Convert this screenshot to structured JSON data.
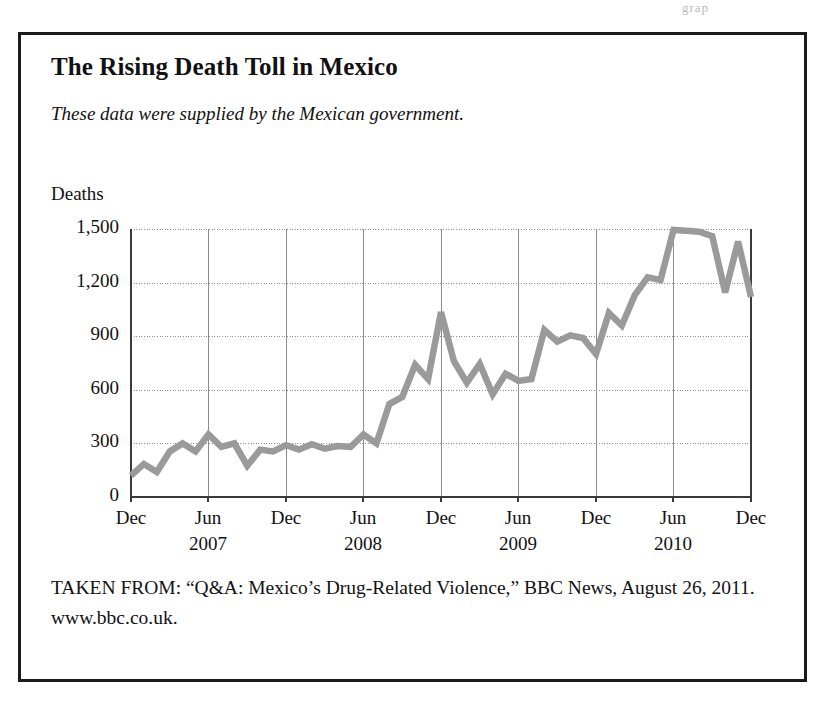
{
  "figure": {
    "title": "The Rising Death Toll in Mexico",
    "subtitle": "These data were supplied by the Mexican government.",
    "y_axis_title": "Deaths",
    "source_note": "TAKEN FROM: “Q&A: Mexico’s Drug-Related Violence,” BBC News, August 26, 2011. www.bbc.co.uk.",
    "scan_artifact": "grap"
  },
  "colors": {
    "line": "#9a9a9a",
    "frame": "#1b1b1b",
    "axis": "#3a3a3a",
    "gridline": "#8d8d8d",
    "background": "#ffffff",
    "text": "#111111"
  },
  "chart_data": {
    "type": "line",
    "title": "The Rising Death Toll in Mexico",
    "subtitle": "These data were supplied by the Mexican government.",
    "xlabel": "",
    "ylabel": "Deaths",
    "ylim": [
      0,
      1500
    ],
    "yticks": [
      0,
      300,
      600,
      900,
      1200,
      1500
    ],
    "ytick_labels": [
      "0",
      "300",
      "600",
      "900",
      "1,200",
      "1,500"
    ],
    "grid": true,
    "legend": null,
    "xtick_labels": [
      "Dec",
      "Jun",
      "Dec",
      "Jun",
      "Dec",
      "Jun",
      "Dec",
      "Jun",
      "Dec"
    ],
    "xtick_years": [
      "",
      "2007",
      "",
      "2008",
      "",
      "2009",
      "",
      "2010",
      ""
    ],
    "xtick_months": [
      "2006-12",
      "2007-06",
      "2007-12",
      "2008-06",
      "2008-12",
      "2009-06",
      "2009-12",
      "2010-06",
      "2010-12"
    ],
    "x": [
      "2006-12",
      "2007-01",
      "2007-02",
      "2007-03",
      "2007-04",
      "2007-05",
      "2007-06",
      "2007-07",
      "2007-08",
      "2007-09",
      "2007-10",
      "2007-11",
      "2007-12",
      "2008-01",
      "2008-02",
      "2008-03",
      "2008-04",
      "2008-05",
      "2008-06",
      "2008-07",
      "2008-08",
      "2008-09",
      "2008-10",
      "2008-11",
      "2008-12",
      "2009-01",
      "2009-02",
      "2009-03",
      "2009-04",
      "2009-05",
      "2009-06",
      "2009-07",
      "2009-08",
      "2009-09",
      "2009-10",
      "2009-11",
      "2009-12",
      "2010-01",
      "2010-02",
      "2010-03",
      "2010-04",
      "2010-05",
      "2010-06",
      "2010-07",
      "2010-08",
      "2010-09",
      "2010-10",
      "2010-11",
      "2010-12"
    ],
    "values": [
      120,
      185,
      140,
      255,
      300,
      255,
      350,
      280,
      300,
      175,
      265,
      255,
      290,
      265,
      295,
      270,
      285,
      280,
      350,
      300,
      520,
      560,
      740,
      660,
      1035,
      760,
      640,
      745,
      575,
      690,
      650,
      660,
      935,
      870,
      905,
      890,
      800,
      1030,
      960,
      1130,
      1230,
      1215,
      1495,
      1490,
      1485,
      1460,
      1145,
      1430,
      1120
    ]
  },
  "plot_geometry": {
    "left": 110,
    "right": 730,
    "top": 194,
    "bottom": 462,
    "x_gridlines": [
      110,
      187,
      265,
      342,
      420,
      497,
      575,
      652,
      730
    ],
    "y_gridlines": [
      194,
      248,
      301,
      355,
      408,
      462
    ]
  }
}
